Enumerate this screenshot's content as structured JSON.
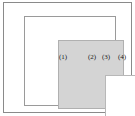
{
  "figure": {
    "type": "nested-squares-diagram",
    "width": 135,
    "height": 116,
    "background_color": "#ffffff",
    "regions": [
      {
        "id": "region-1",
        "label": "(1)",
        "description": "innermost white square",
        "fill_color": "#ffffff",
        "border_color": "#b8b8b8"
      },
      {
        "id": "region-2",
        "label": "(2)",
        "description": "gray shaded band surrounding the innermost square",
        "fill_color": "#d4d4d4",
        "border_color": "#b0b0b0"
      },
      {
        "id": "region-3",
        "label": "(3)",
        "description": "white band between the gray square and the middle outline",
        "fill_color": "#ffffff",
        "border_color": "#9a9a9a"
      },
      {
        "id": "region-4",
        "label": "(4)",
        "description": "outermost white band inside the outer frame",
        "fill_color": "#ffffff",
        "border_color": "#8a8a8a"
      }
    ]
  }
}
